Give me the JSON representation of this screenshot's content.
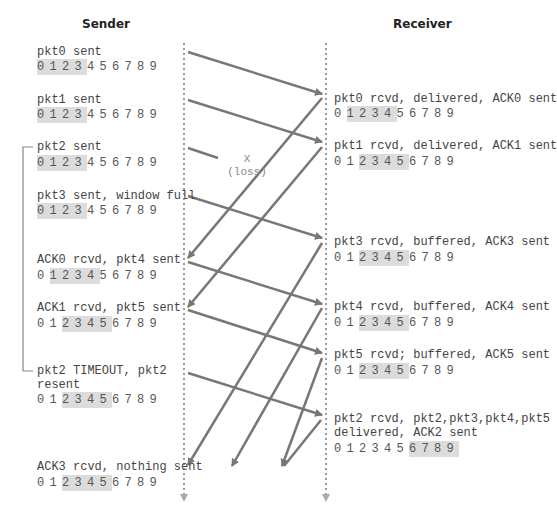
{
  "headers": {
    "sender": "Sender",
    "receiver": "Receiver"
  },
  "loss_marker": {
    "x": "X",
    "label": "(loss)"
  },
  "colors": {
    "arrow": "#777777",
    "timeline": "#9a9a9a",
    "window_highlight": "#dcdcdc",
    "text": "#444444"
  },
  "sender": {
    "events": [
      {
        "label": "pkt0 sent",
        "window": [
          0,
          1,
          2,
          3
        ]
      },
      {
        "label": "pkt1 sent",
        "window": [
          0,
          1,
          2,
          3
        ]
      },
      {
        "label": "pkt2 sent",
        "window": [
          0,
          1,
          2,
          3
        ]
      },
      {
        "label": "pkt3 sent, window full",
        "window": [
          0,
          1,
          2,
          3
        ]
      },
      {
        "label": "ACK0 rcvd, pkt4 sent",
        "window": [
          1,
          2,
          3,
          4
        ]
      },
      {
        "label": "ACK1 rcvd, pkt5 sent",
        "window": [
          2,
          3,
          4,
          5
        ]
      },
      {
        "label": "pkt2 TIMEOUT, pkt2\nresent",
        "window": [
          2,
          3,
          4,
          5
        ]
      },
      {
        "label": "ACK3 rcvd, nothing sent",
        "window": [
          2,
          3,
          4,
          5
        ]
      }
    ]
  },
  "receiver": {
    "events": [
      {
        "label": "pkt0 rcvd, delivered, ACK0 sent",
        "window": [
          1,
          2,
          3,
          4
        ]
      },
      {
        "label": "pkt1 rcvd, delivered, ACK1 sent",
        "window": [
          2,
          3,
          4,
          5
        ]
      },
      {
        "label": "pkt3 rcvd, buffered, ACK3 sent",
        "window": [
          2,
          3,
          4,
          5
        ]
      },
      {
        "label": "pkt4 rcvd, buffered, ACK4 sent",
        "window": [
          2,
          3,
          4,
          5
        ]
      },
      {
        "label": "pkt5 rcvd; buffered, ACK5 sent",
        "window": [
          2,
          3,
          4,
          5
        ]
      },
      {
        "label": "pkt2 rcvd, pkt2,pkt3,pkt4,pkt5\ndelivered, ACK2 sent",
        "window": [
          6,
          7,
          8,
          9
        ]
      }
    ]
  },
  "sequence_numbers": [
    "0",
    "1",
    "2",
    "3",
    "4",
    "5",
    "6",
    "7",
    "8",
    "9"
  ]
}
